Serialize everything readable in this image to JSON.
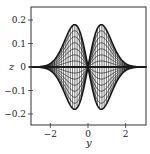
{
  "chart_data": {
    "type": "line",
    "title": "",
    "xlabel": "y",
    "ylabel": "z",
    "xlim": [
      -3.1,
      3.1
    ],
    "ylim": [
      -0.25,
      0.25
    ],
    "xticks": [
      -2,
      0,
      2
    ],
    "xtick_labels": [
      "−2",
      "0",
      "2"
    ],
    "yticks": [
      -0.2,
      -0.1,
      0,
      0.1,
      0.2
    ],
    "ytick_labels": [
      "−0.2",
      "−0.1",
      "0",
      "0.1",
      "0.2"
    ],
    "grid": false,
    "legend": null,
    "curve_family": {
      "formula": "z = c * y * exp(-y^2)",
      "c_values": [
        -0.42,
        -0.36,
        -0.3,
        -0.24,
        -0.18,
        -0.12,
        -0.06,
        0,
        0.06,
        0.12,
        0.18,
        0.24,
        0.3,
        0.36,
        0.42
      ],
      "peak_y": [
        -0.707,
        0.707
      ],
      "peak_abs_z": 0.18
    },
    "mesh_vertical_lines": {
      "y_from": -2.5,
      "y_to": 2.5,
      "step": 0.12
    },
    "line_color": "#1a1a1a"
  }
}
